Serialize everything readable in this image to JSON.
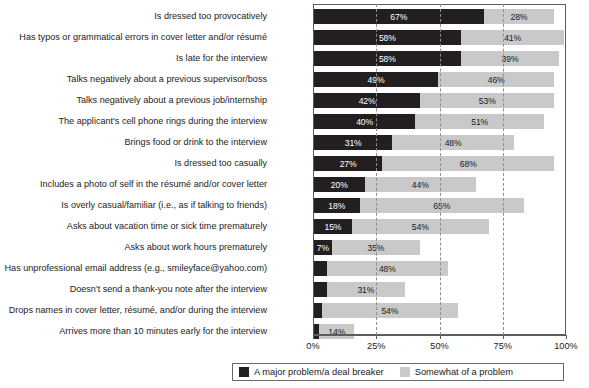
{
  "chart_data": {
    "type": "bar",
    "orientation": "horizontal",
    "stacked": true,
    "title": "",
    "subtitle": "",
    "xlabel": "",
    "ylabel": "",
    "xlim": [
      0,
      100
    ],
    "xticks": [
      "0%",
      "25%",
      "50%",
      "75%",
      "100%"
    ],
    "xtick_values": [
      0,
      25,
      50,
      75,
      100
    ],
    "grid": "vertical-dashed",
    "legend_position": "bottom",
    "categories": [
      "Is dressed too provocatively",
      "Has typos or grammatical errors in cover letter and/or résumé",
      "Is late for the interview",
      "Talks negatively about a previous supervisor/boss",
      "Talks negatively about a previous job/internship",
      "The applicant's cell phone rings during the interview",
      "Brings food or drink to the interview",
      "Is dressed too casually",
      "Includes a photo of self in the résumé and/or cover letter",
      "Is overly casual/familiar (i.e., as if talking to friends)",
      "Asks about vacation time or sick time prematurely",
      "Asks about work hours prematurely",
      "Has unprofessional email address (e.g., smileyface@yahoo.com)",
      "Doesn't send a thank-you note after the interview",
      "Drops names in cover letter, résumé, and/or during the interview",
      "Arrives more than 10 minutes early for the interview"
    ],
    "series": [
      {
        "name": "A major problem/a deal breaker",
        "color": "#231f20",
        "values": [
          67,
          58,
          58,
          49,
          42,
          40,
          31,
          27,
          20,
          18,
          15,
          7,
          5,
          5,
          3,
          2
        ],
        "labels": [
          "67%",
          "58%",
          "58%",
          "49%",
          "42%",
          "40%",
          "31%",
          "27%",
          "20%",
          "18%",
          "15%",
          "7%",
          "",
          "",
          "",
          ""
        ]
      },
      {
        "name": "Somewhat of a problem",
        "color": "#c9c9c9",
        "values": [
          28,
          41,
          39,
          46,
          53,
          51,
          48,
          68,
          44,
          65,
          54,
          35,
          48,
          31,
          54,
          14
        ],
        "labels": [
          "28%",
          "41%",
          "39%",
          "46%",
          "53%",
          "51%",
          "48%",
          "68%",
          "44%",
          "65%",
          "54%",
          "35%",
          "48%",
          "31%",
          "54%",
          "14%"
        ]
      }
    ]
  },
  "legend": {
    "items": [
      {
        "label": "A major problem/a deal breaker",
        "color": "#231f20"
      },
      {
        "label": "Somewhat of a problem",
        "color": "#c9c9c9"
      }
    ]
  }
}
